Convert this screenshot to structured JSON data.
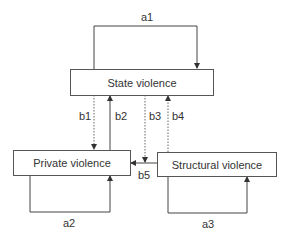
{
  "diagram": {
    "nodes": {
      "state": "State violence",
      "private": "Private violence",
      "structural": "Structural violence"
    },
    "edges": {
      "a1": "a1",
      "a2": "a2",
      "a3": "a3",
      "b1": "b1",
      "b2": "b2",
      "b3": "b3",
      "b4": "b4",
      "b5": "b5"
    },
    "edge_list": [
      {
        "id": "a1",
        "from": "State violence",
        "to": "State violence",
        "style": "solid"
      },
      {
        "id": "a2",
        "from": "Private violence",
        "to": "Private violence",
        "style": "solid"
      },
      {
        "id": "a3",
        "from": "Structural violence",
        "to": "Structural violence",
        "style": "solid"
      },
      {
        "id": "b1",
        "from": "State violence",
        "to": "Private violence",
        "style": "dotted"
      },
      {
        "id": "b2",
        "from": "Private violence",
        "to": "State violence",
        "style": "solid"
      },
      {
        "id": "b3",
        "from": "State violence",
        "to": "Private violence",
        "style": "dotted"
      },
      {
        "id": "b4",
        "from": "Structural violence",
        "to": "State violence",
        "style": "dotted"
      },
      {
        "id": "b5",
        "from": "Structural violence",
        "to": "Private violence",
        "style": "solid"
      }
    ],
    "colors": {
      "line": "#444444",
      "text": "#333333"
    }
  }
}
